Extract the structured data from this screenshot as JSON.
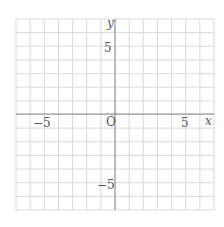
{
  "diagram": {
    "type": "coordinate-grid",
    "x_axis": {
      "label": "x",
      "min": -7,
      "max": 7,
      "tick_labels": [
        "−5",
        "5"
      ]
    },
    "y_axis": {
      "label": "y",
      "min": -7,
      "max": 7,
      "tick_labels": [
        "5",
        "−5"
      ]
    },
    "origin_label": "O",
    "grid_step": 1,
    "colors": {
      "grid": "#d9d9d9",
      "axis": "#8a8a8a",
      "text": "#555555",
      "background": "#ffffff"
    }
  },
  "labels": {
    "x_axis": "x",
    "y_axis": "y",
    "origin": "O",
    "x_neg5": "−5",
    "x_pos5": "5",
    "y_pos5": "5",
    "y_neg5": "−5"
  }
}
